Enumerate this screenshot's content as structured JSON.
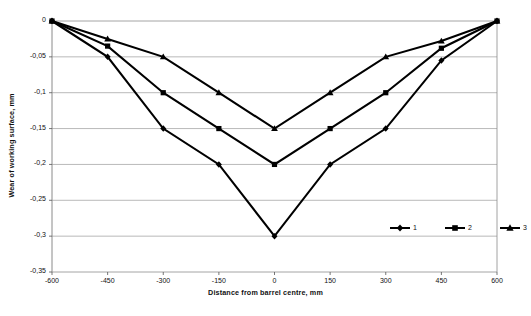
{
  "chart_data": {
    "type": "line",
    "title": "",
    "xlabel": "Distance from barrel centre, mm",
    "ylabel": "Wear of working surface, mm",
    "x": [
      -600,
      -450,
      -300,
      -150,
      0,
      150,
      300,
      450,
      600
    ],
    "xtick_labels": [
      "-600",
      "-450",
      "-300",
      "-150",
      "0",
      "150",
      "300",
      "450",
      "600"
    ],
    "ytick_labels": [
      "0",
      "-0,05",
      "-0,1",
      "-0,15",
      "-0,2",
      "-0,25",
      "-0,3",
      "-0,35"
    ],
    "ytick_values": [
      0,
      -0.05,
      -0.1,
      -0.15,
      -0.2,
      -0.25,
      -0.3,
      -0.35
    ],
    "xlim": [
      -600,
      600
    ],
    "ylim": [
      -0.35,
      0
    ],
    "grid": "horizontal",
    "legend_position": "inside-bottom-right",
    "series": [
      {
        "name": "1",
        "marker": "diamond",
        "color": "#000000",
        "values": [
          0,
          -0.05,
          -0.15,
          -0.2,
          -0.3,
          -0.2,
          -0.15,
          -0.055,
          0
        ]
      },
      {
        "name": "2",
        "marker": "square",
        "color": "#000000",
        "values": [
          0,
          -0.035,
          -0.1,
          -0.15,
          -0.2,
          -0.15,
          -0.1,
          -0.038,
          0
        ]
      },
      {
        "name": "3",
        "marker": "triangle",
        "color": "#000000",
        "values": [
          0,
          -0.025,
          -0.05,
          -0.1,
          -0.15,
          -0.1,
          -0.05,
          -0.028,
          0
        ]
      }
    ]
  },
  "legend": {
    "items": [
      {
        "label": "1",
        "marker": "diamond"
      },
      {
        "label": "2",
        "marker": "square"
      },
      {
        "label": "3",
        "marker": "triangle"
      }
    ]
  }
}
